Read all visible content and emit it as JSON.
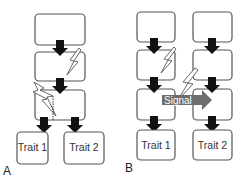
{
  "panels": {
    "a": {
      "label": "A",
      "traits": [
        "Trait 1",
        "Trait 2"
      ]
    },
    "b": {
      "label": "B",
      "traits": [
        "Trait 1",
        "Trait 2"
      ],
      "signal_label": "Signal"
    }
  },
  "colors": {
    "box_stroke": "#555555",
    "arrow": "#111111",
    "signal_arrow": "#6e6e6e"
  }
}
